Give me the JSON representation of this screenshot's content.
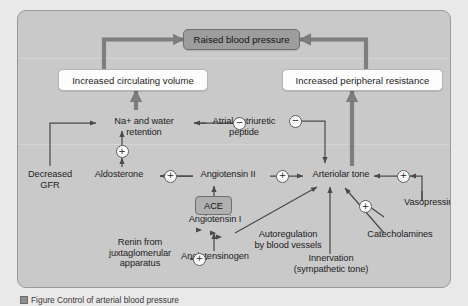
{
  "figure": {
    "caption": "Figure  Control of arterial blood pressure"
  },
  "colors": {
    "panel_bg": "#c9c9c9",
    "page_bg": "#e9e9e9",
    "thick_arrow": "#7e7e7e",
    "thin_arrow": "#4a4a4a",
    "gray_box_fill": "#9d9d9d",
    "white_box_fill": "#fdfdfd"
  },
  "boxes": {
    "raised_bp": "Raised blood pressure",
    "increased_volume": "Increased circulating volume",
    "increased_resistance": "Increased peripheral resistance",
    "ace": "ACE"
  },
  "nodes": {
    "na_water": "Na+ and water\nretention",
    "atrial_natriuretic": "Atrial natriuretic\npeptide",
    "decreased_gfr": "Decreased\nGFR",
    "aldosterone": "Aldosterone",
    "angiotensin_ii": "Angiotensin II",
    "arteriolar_tone": "Arteriolar tone",
    "angiotensin_i": "Angiotensin I",
    "autoregulation": "Autoregulation\nby blood vessels",
    "catecholamines": "Catecholamines",
    "vasopressin": "Vasopressin",
    "renin": "Renin from\njuxtaglomerular\napparatus",
    "angiotensinogen": "Angiotensinogen",
    "innervation": "Innervation\n(sympathetic tone)"
  },
  "signs": {
    "anp_to_na": "−",
    "aldosterone_to_na": "+",
    "ang2_to_aldosterone": "+",
    "ang2_to_tone": "+",
    "anp_to_tone": "−",
    "vasopressin_to_tone": "+",
    "catecholamines_to_tone": "+",
    "renin_to_ang1": "+"
  }
}
